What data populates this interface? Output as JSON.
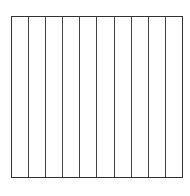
{
  "diagram": {
    "caption": "",
    "grid": {
      "columns": 10,
      "line_color": "#333333",
      "background": "#ffffff"
    }
  }
}
